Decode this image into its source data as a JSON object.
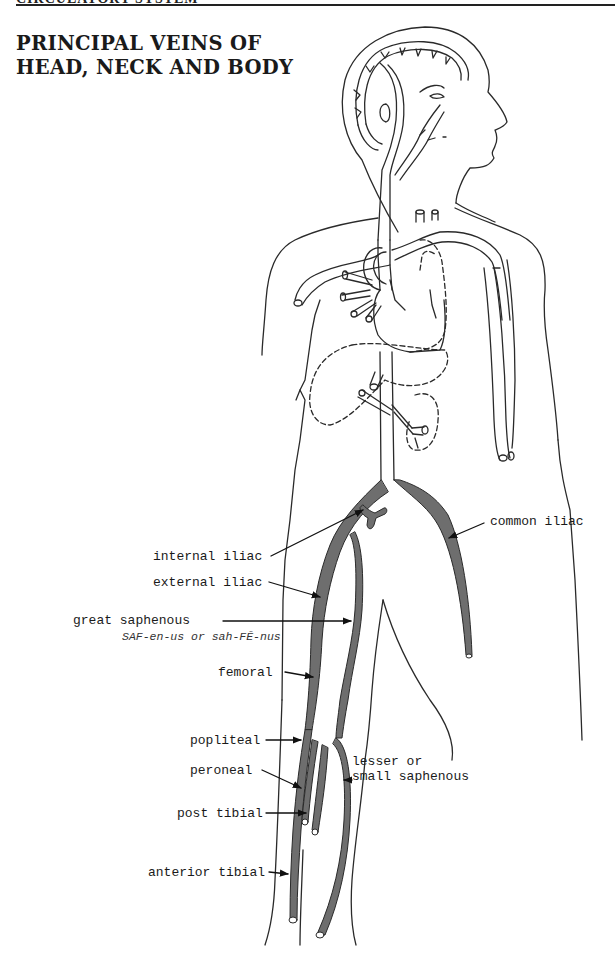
{
  "page": {
    "running_header": "CIRCULATORY SYSTEM",
    "title_lines": [
      "PRINCIPAL VEINS OF",
      "HEAD, NECK AND BODY"
    ]
  },
  "figure": {
    "vein_fill_color": "#6e6e6e",
    "outline_color": "#2a2a2a",
    "labels": [
      {
        "id": "common-iliac",
        "text": "common iliac"
      },
      {
        "id": "internal-iliac",
        "text": "internal iliac"
      },
      {
        "id": "external-iliac",
        "text": "external iliac"
      },
      {
        "id": "great-saphenous",
        "text": "great saphenous",
        "pronunciation": "SAF-en-us or sah-FĒ-nus"
      },
      {
        "id": "femoral",
        "text": "femoral"
      },
      {
        "id": "popliteal",
        "text": "popliteal"
      },
      {
        "id": "lesser-saphenous",
        "text_line1": "lesser or",
        "text_line2": "small saphenous"
      },
      {
        "id": "peroneal",
        "text": "peroneal"
      },
      {
        "id": "post-tibial",
        "text": "post tibial"
      },
      {
        "id": "anterior-tibial",
        "text": "anterior tibial"
      }
    ]
  }
}
